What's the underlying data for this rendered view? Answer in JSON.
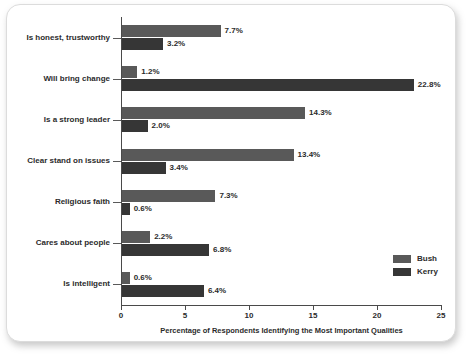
{
  "chart_data": {
    "type": "bar",
    "orientation": "horizontal",
    "grouped": true,
    "title": "",
    "xlabel": "Percentage of Respondents Identifying the Most Important Qualities",
    "ylabel": "",
    "xlim": [
      0,
      25
    ],
    "xticks": [
      "0",
      "5",
      "10",
      "15",
      "20",
      "25"
    ],
    "grid": false,
    "legend_position": "bottom-right",
    "categories": [
      "Is honest, trustworthy",
      "Will bring change",
      "Is a strong leader",
      "Clear stand on issues",
      "Religious faith",
      "Cares about people",
      "Is intelligent"
    ],
    "series": [
      {
        "name": "Bush",
        "color": "#595959",
        "values": [
          7.7,
          1.2,
          14.3,
          13.4,
          7.3,
          2.2,
          0.6
        ],
        "labels": [
          "7.7%",
          "1.2%",
          "14.3%",
          "13.4%",
          "7.3%",
          "2.2%",
          "0.6%"
        ]
      },
      {
        "name": "Kerry",
        "color": "#363636",
        "values": [
          3.2,
          22.8,
          2.0,
          3.4,
          0.6,
          6.8,
          6.4
        ],
        "labels": [
          "3.2%",
          "22.8%",
          "2.0%",
          "3.4%",
          "0.6%",
          "6.8%",
          "6.4%"
        ]
      }
    ]
  },
  "legend": {
    "items": [
      {
        "label": "Bush",
        "color": "#595959"
      },
      {
        "label": "Kerry",
        "color": "#363636"
      }
    ]
  }
}
